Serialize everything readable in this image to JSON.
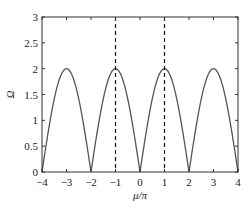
{
  "chart_data": {
    "type": "line",
    "title": "",
    "xlabel": "μ/π",
    "ylabel": "Ω",
    "xlim": [
      -4,
      4
    ],
    "ylim": [
      0,
      3
    ],
    "xticks": [
      "−4",
      "−3",
      "−2",
      "−1",
      "0",
      "1",
      "2",
      "3",
      "4"
    ],
    "yticks": [
      "0",
      "0.5",
      "1",
      "1.5",
      "2",
      "2.5",
      "3"
    ],
    "grid": false,
    "series": [
      {
        "name": "Ω(μ)",
        "function": "2|sin(πx/2)|",
        "x": [
          -4,
          -3,
          -2,
          -1,
          0,
          1,
          2,
          3,
          4
        ],
        "values": [
          0,
          2,
          0,
          2,
          0,
          2,
          0,
          2,
          0
        ],
        "color": "#555555"
      }
    ],
    "annotations": [
      {
        "type": "vline",
        "x": -1,
        "style": "dashed"
      },
      {
        "type": "vline",
        "x": 1,
        "style": "dashed"
      }
    ]
  }
}
